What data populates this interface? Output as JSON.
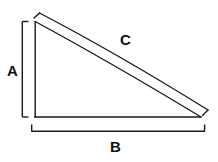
{
  "figure": {
    "type": "geometry-diagram",
    "background_color": "#ffffff",
    "stroke_color": "#1a1a1a",
    "stroke_width": 1.4,
    "labels": {
      "leg_vertical": "A",
      "leg_horizontal": "B",
      "hypotenuse": "C"
    },
    "shapes": {
      "triangle": {
        "name": "right-triangle",
        "vertices": {
          "top_left": [
            35,
            21
          ],
          "bottom_left": [
            35,
            117
          ],
          "bottom_right": [
            201,
            117
          ]
        }
      },
      "bracket_a": {
        "name": "vertical-dimension-bracket",
        "from": [
          22,
          21
        ],
        "to": [
          22,
          117
        ],
        "tick_length": 6,
        "tick_direction": "right"
      },
      "bracket_b": {
        "name": "horizontal-dimension-bracket",
        "from": [
          31,
          131
        ],
        "to": [
          205,
          131
        ],
        "tick_length": 6,
        "tick_direction": "up"
      },
      "bracket_c": {
        "name": "hypotenuse-dimension-bracket",
        "from": [
          39,
          13
        ],
        "to": [
          208,
          110
        ],
        "tick_length": 7
      }
    }
  }
}
